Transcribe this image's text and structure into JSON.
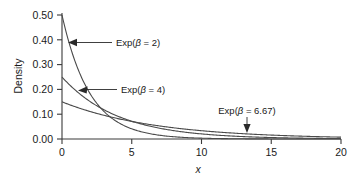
{
  "chart_data": {
    "type": "line",
    "title": "",
    "xlabel": "x",
    "ylabel": "Density",
    "xlim": [
      0,
      20
    ],
    "ylim": [
      0.0,
      0.5
    ],
    "grid": false,
    "legend_position": "inline-annotations",
    "x_ticks": [
      "0",
      "5",
      "10",
      "15",
      "20"
    ],
    "x_tick_values": [
      0,
      5,
      10,
      15,
      20
    ],
    "y_ticks": [
      "0.00",
      "0.10",
      "0.20",
      "0.30",
      "0.40",
      "0.50"
    ],
    "y_tick_values": [
      0.0,
      0.1,
      0.2,
      0.3,
      0.4,
      0.5
    ],
    "x": [
      0,
      0.5,
      1,
      1.5,
      2,
      2.5,
      3,
      3.5,
      4,
      5,
      6,
      7,
      8,
      9,
      10,
      11,
      12,
      13,
      14,
      15,
      16,
      17,
      18,
      19,
      20
    ],
    "series": [
      {
        "name": "Exp(β = 2)",
        "beta": 2,
        "values": [
          0.5,
          0.3894,
          0.3033,
          0.2362,
          0.1839,
          0.1433,
          0.1116,
          0.0869,
          0.0677,
          0.041,
          0.0249,
          0.0151,
          0.0092,
          0.0056,
          0.0034,
          0.002,
          0.0012,
          0.0008,
          0.0005,
          0.0003,
          0.0002,
          0.0001,
          0.0001,
          0.0,
          0.0
        ]
      },
      {
        "name": "Exp(β = 4)",
        "beta": 4,
        "values": [
          0.25,
          0.2206,
          0.1947,
          0.1718,
          0.1516,
          0.1338,
          0.1181,
          0.1042,
          0.0919,
          0.0716,
          0.0558,
          0.0435,
          0.0338,
          0.0264,
          0.0205,
          0.016,
          0.0124,
          0.0097,
          0.0075,
          0.0059,
          0.0046,
          0.0036,
          0.0028,
          0.0022,
          0.0017
        ]
      },
      {
        "name": "Exp(β = 6.67)",
        "beta": 6.67,
        "values": [
          0.15,
          0.1392,
          0.1293,
          0.12,
          0.1114,
          0.1034,
          0.096,
          0.0892,
          0.0828,
          0.0713,
          0.0615,
          0.053,
          0.0457,
          0.0394,
          0.0339,
          0.0292,
          0.0252,
          0.0217,
          0.0187,
          0.0161,
          0.0139,
          0.012,
          0.0103,
          0.0089,
          0.0077
        ]
      }
    ],
    "annotations": [
      {
        "label": "Exp(β = 2)",
        "prefix": "Exp(",
        "symbol": "β",
        "suffix": " = 2)",
        "arrow": "left"
      },
      {
        "label": "Exp(β = 4)",
        "prefix": "Exp(",
        "symbol": "β",
        "suffix": " = 4)",
        "arrow": "left"
      },
      {
        "label": "Exp(β = 6.67)",
        "prefix": "Exp(",
        "symbol": "β",
        "suffix": " = 6.67)",
        "arrow": "down"
      }
    ],
    "colors": {
      "background": "#ffffff",
      "curve": "#4a4a4a",
      "axis": "#3a3a3a",
      "text": "#1a1a1a"
    }
  }
}
